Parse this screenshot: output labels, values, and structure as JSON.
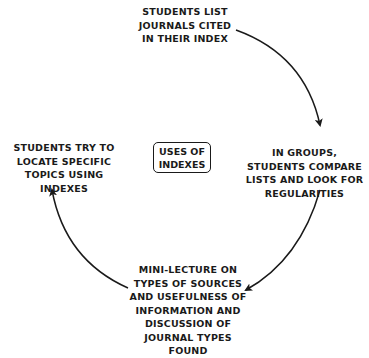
{
  "diagram": {
    "type": "cycle",
    "center": {
      "lines": [
        "USES OF",
        "INDEXES"
      ]
    },
    "nodes": {
      "top": {
        "lines": [
          "STUDENTS LIST",
          "JOURNALS CITED",
          "IN THEIR INDEX"
        ]
      },
      "right": {
        "lines": [
          "IN GROUPS,",
          "STUDENTS COMPARE",
          "LISTS AND LOOK FOR",
          "REGULARITIES"
        ]
      },
      "bottom": {
        "lines": [
          "MINI-LECTURE ON",
          "TYPES OF SOURCES",
          "AND USEFULNESS OF",
          "INFORMATION AND",
          "DISCUSSION OF",
          "JOURNAL TYPES",
          "FOUND"
        ]
      },
      "left": {
        "lines": [
          "STUDENTS TRY TO",
          "LOCATE SPECIFIC",
          "TOPICS USING",
          "INDEXES"
        ]
      }
    },
    "edges": [
      {
        "from": "top",
        "to": "right",
        "direction": "clockwise"
      },
      {
        "from": "right",
        "to": "bottom",
        "direction": "clockwise"
      },
      {
        "from": "bottom",
        "to": "left",
        "direction": "clockwise"
      }
    ],
    "colors": {
      "stroke": "#1a1a1a",
      "background": "#ffffff"
    }
  }
}
